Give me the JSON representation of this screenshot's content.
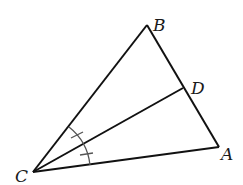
{
  "diagram": {
    "type": "triangle-with-angle-bisector",
    "points": {
      "A": {
        "label": "A",
        "x": 219,
        "y": 147
      },
      "B": {
        "label": "B",
        "x": 147,
        "y": 25
      },
      "C": {
        "label": "C",
        "x": 33,
        "y": 172
      },
      "D": {
        "label": "D",
        "x": 183,
        "y": 88
      }
    },
    "segments": [
      "CB",
      "BA",
      "AC",
      "CD"
    ],
    "angle_marks": {
      "vertex": "C",
      "description": "angle BCD equals angle DCA (single tick marks)"
    },
    "colors": {
      "line": "#111111",
      "mark": "#555555"
    }
  }
}
